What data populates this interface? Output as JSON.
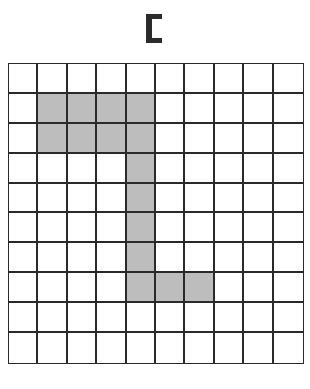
{
  "title": {
    "glyph": "bracket-shape",
    "description": "Target shape shown as a small black bracket icon"
  },
  "grid": {
    "rows": 10,
    "cols": 10,
    "fill_color": "#bdbdbd",
    "line_color": "#2a2a2a",
    "filled_cells": [
      [
        1,
        1
      ],
      [
        1,
        2
      ],
      [
        1,
        3
      ],
      [
        1,
        4
      ],
      [
        2,
        1
      ],
      [
        2,
        2
      ],
      [
        2,
        3
      ],
      [
        2,
        4
      ],
      [
        3,
        4
      ],
      [
        4,
        4
      ],
      [
        5,
        4
      ],
      [
        6,
        4
      ],
      [
        7,
        4
      ],
      [
        7,
        5
      ],
      [
        7,
        6
      ]
    ]
  }
}
